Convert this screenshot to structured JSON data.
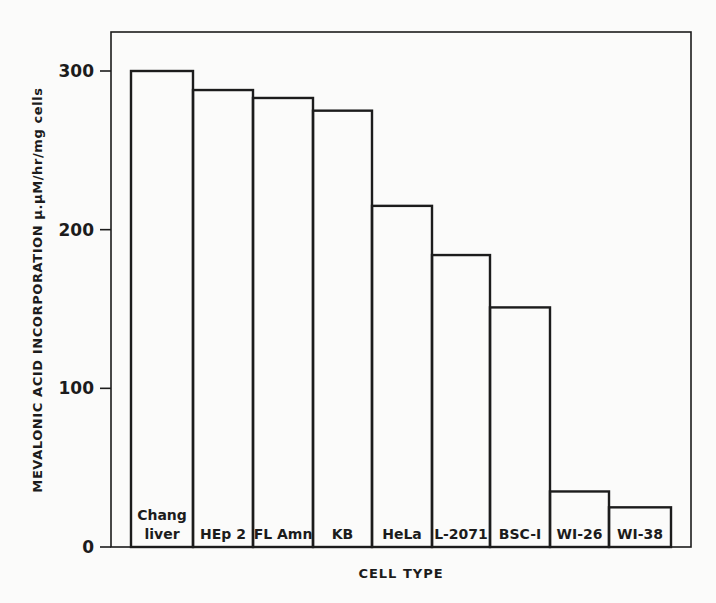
{
  "chart_data": {
    "type": "bar",
    "title": "",
    "xlabel": "CELL TYPE",
    "ylabel": "MEVALONIC ACID INCORPORATION μ.μM/hr/mg cells",
    "ylim": [
      0,
      325
    ],
    "yticks": [
      0,
      100,
      200,
      300
    ],
    "grid": false,
    "legend": null,
    "categories": [
      "Chang liver",
      "HEp 2",
      "FL Amn",
      "KB",
      "HeLa",
      "L-2071",
      "BSC-I",
      "WI-26",
      "WI-38"
    ],
    "category_lines": [
      [
        "Chang",
        "liver"
      ],
      [
        "HEp 2"
      ],
      [
        "FL Amn"
      ],
      [
        "KB"
      ],
      [
        "HeLa"
      ],
      [
        "L-2071"
      ],
      [
        "BSC-I"
      ],
      [
        "WI-26"
      ],
      [
        "WI-38"
      ]
    ],
    "values": [
      300,
      288,
      283,
      275,
      215,
      184,
      151,
      35,
      25
    ],
    "bar_edges_px": [
      131,
      193,
      253,
      313,
      372,
      432,
      490,
      550,
      609,
      671
    ]
  },
  "colors": {
    "background": "#fbfbfa",
    "ink": "#1c1c1c"
  }
}
